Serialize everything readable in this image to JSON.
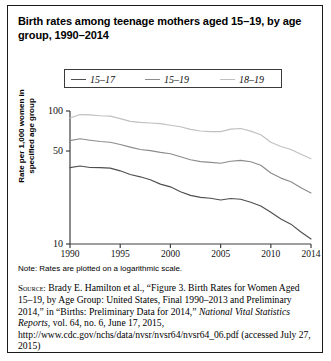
{
  "figure": {
    "title": "Birth rates among teenage mothers aged 15–19, by age group, 1990–2014",
    "note": "Note: Rates are plotted on a logarithmic scale.",
    "source_prefix": "Source:",
    "source_part1": " Brady E. Hamilton et al., “Figure 3. Birth Rates for Women Aged 15–19, by Age Group: United States, Final 1990–2013 and Preliminary 2014,” in “Births: Preliminary Data for 2014,” ",
    "source_italic1": "National Vital Statistics Reports",
    "source_part2": ", vol. 64, no. 6, June 17, 2015, http://www.cdc.gov/nchs/data/nvsr/nvsr64/nvsr64_06.pdf (accessed July 27, 2015)"
  },
  "chart_data": {
    "type": "line",
    "title": "Birth rates among teenage mothers aged 15–19, by age group, 1990–2014",
    "xlabel": "",
    "ylabel": "Rate per 1,000 women in specified age group",
    "yscale": "log",
    "ylim": [
      10,
      100
    ],
    "xlim": [
      1990,
      2014
    ],
    "grid": false,
    "legend_position": "top-center",
    "ytick_labels": [
      "100",
      "50",
      "10"
    ],
    "ytick_values": [
      100,
      50,
      10
    ],
    "xtick_labels": [
      "1990",
      "1995",
      "2000",
      "2005",
      "2010",
      "2014"
    ],
    "xtick_values": [
      1990,
      1995,
      2000,
      2005,
      2010,
      2014
    ],
    "x": [
      1990,
      1991,
      1992,
      1993,
      1994,
      1995,
      1996,
      1997,
      1998,
      1999,
      2000,
      2001,
      2002,
      2003,
      2004,
      2005,
      2006,
      2007,
      2008,
      2009,
      2010,
      2011,
      2012,
      2013,
      2014
    ],
    "series": [
      {
        "name": "15–17",
        "color": "#4f4f4f",
        "values": [
          37.5,
          38.6,
          37.6,
          37.5,
          37.2,
          35.5,
          33.3,
          32.0,
          30.4,
          28.2,
          26.9,
          24.7,
          23.2,
          22.4,
          22.1,
          21.4,
          22.0,
          21.7,
          20.6,
          19.3,
          17.3,
          15.4,
          14.1,
          12.3,
          10.9
        ]
      },
      {
        "name": "15–19",
        "color": "#8c8c8c",
        "values": [
          59.9,
          61.8,
          60.3,
          59.0,
          58.2,
          56.0,
          53.5,
          51.3,
          50.3,
          48.8,
          47.7,
          45.3,
          43.0,
          41.6,
          41.1,
          40.5,
          41.9,
          42.5,
          41.5,
          39.1,
          34.2,
          31.3,
          29.4,
          26.5,
          24.2
        ]
      },
      {
        "name": "18–19",
        "color": "#c0c0c0",
        "values": [
          88.6,
          94.0,
          93.6,
          92.1,
          91.5,
          87.7,
          83.6,
          82.1,
          81.3,
          80.3,
          78.1,
          76.1,
          72.8,
          70.7,
          70.0,
          69.9,
          73.0,
          73.9,
          70.6,
          66.2,
          58.3,
          54.1,
          51.4,
          47.3,
          43.8
        ]
      }
    ]
  }
}
